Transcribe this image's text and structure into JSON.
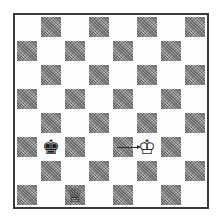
{
  "diagram": {
    "type": "chess-position",
    "orientation": "white-at-bottom",
    "files": [
      "a",
      "b",
      "c",
      "d",
      "e",
      "f",
      "g",
      "h"
    ],
    "ranks": [
      8,
      7,
      6,
      5,
      4,
      3,
      2,
      1
    ],
    "colors": {
      "light_square": "#fdfdfd",
      "dark_square": "#9a9a9a",
      "border": "#3a3a3a"
    },
    "pieces": [
      {
        "square": "b3",
        "color": "black",
        "type": "king",
        "glyph": "♚",
        "icon": "black-king-icon"
      },
      {
        "square": "f3",
        "color": "white",
        "type": "king",
        "glyph": "♔",
        "icon": "white-king-icon"
      },
      {
        "square": "c1",
        "color": "white",
        "type": "queen",
        "glyph": "♕",
        "icon": "white-queen-icon"
      }
    ],
    "arrows": [
      {
        "from": "e3",
        "to": "f3",
        "icon": "move-arrow-icon"
      }
    ]
  }
}
